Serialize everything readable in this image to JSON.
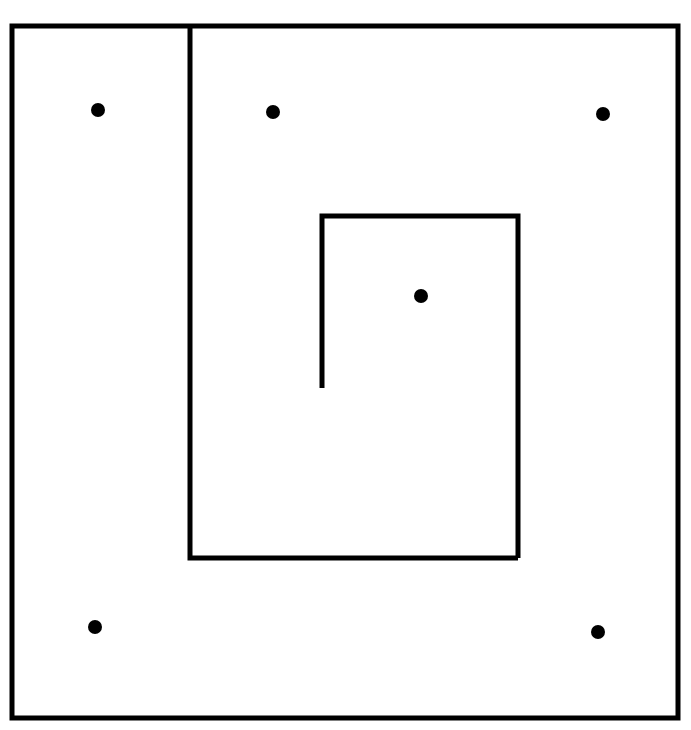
{
  "figure": {
    "kind": "floor-plan-line-diagram",
    "canvas": {
      "width": 691,
      "height": 730
    },
    "background_color": "#ffffff",
    "ink_color": "#000000"
  },
  "chart_data": {
    "type": "diagram",
    "xlabel": "",
    "ylabel": "",
    "xlim": [
      0,
      691
    ],
    "ylim": [
      0,
      730
    ],
    "grid": false,
    "legend": null,
    "units": "pixels",
    "shapes": [
      {
        "name": "outer-room",
        "type": "rectangle",
        "x1": 12,
        "y1": 26,
        "x2": 678,
        "y2": 718,
        "width": 666,
        "height": 692,
        "closed": true,
        "stroke_width": 5,
        "color": "#000000"
      },
      {
        "name": "middle-room",
        "type": "polyline",
        "description": "vertical wall descending from the outer top wall, then turning right to meet the inner room's lower right corner",
        "points": [
          [
            190,
            26
          ],
          [
            190,
            558
          ],
          [
            518,
            558
          ]
        ],
        "closed": false,
        "stroke_width": 5,
        "color": "#000000"
      },
      {
        "name": "inner-room",
        "type": "polyline",
        "description": "three-and-a-half sided inner rectangle: the left wall stops partway down leaving a doorway gap",
        "points": [
          [
            322,
            388
          ],
          [
            322,
            216
          ],
          [
            518,
            216
          ],
          [
            518,
            558
          ]
        ],
        "closed": false,
        "stroke_width": 5,
        "color": "#000000"
      }
    ],
    "gaps": [
      {
        "name": "inner-room-doorway",
        "wall": "inner-room-left-wall",
        "x": 322,
        "y_from": 388,
        "y_to": 558,
        "length": 170
      }
    ],
    "points": [
      {
        "label": "dot-top-left",
        "x": 98,
        "y": 110,
        "r": 7,
        "color": "#000000",
        "region": "outer-left-corridor"
      },
      {
        "label": "dot-top-middle",
        "x": 273,
        "y": 112,
        "r": 7,
        "color": "#000000",
        "region": "middle-room"
      },
      {
        "label": "dot-top-right",
        "x": 603,
        "y": 114,
        "r": 7,
        "color": "#000000",
        "region": "middle-room"
      },
      {
        "label": "dot-center",
        "x": 421,
        "y": 296,
        "r": 7,
        "color": "#000000",
        "region": "inner-room"
      },
      {
        "label": "dot-bottom-left",
        "x": 95,
        "y": 627,
        "r": 7,
        "color": "#000000",
        "region": "outer-left-corridor"
      },
      {
        "label": "dot-bottom-right",
        "x": 598,
        "y": 632,
        "r": 7,
        "color": "#000000",
        "region": "outer-room-lower"
      }
    ],
    "counts": {
      "rectangular_enclosures": 3,
      "marker_dots": 6
    }
  }
}
